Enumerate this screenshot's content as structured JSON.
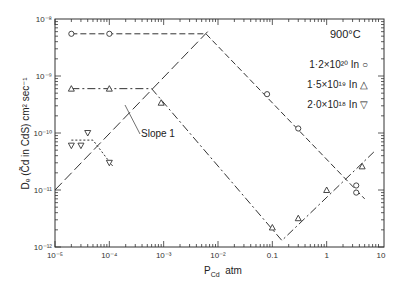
{
  "chart_data": {
    "type": "scatter",
    "title": "",
    "annotation_temperature": "900°C",
    "annotation_slope": "Slope 1",
    "xlabel": "P",
    "xlabel_sub": "Cd",
    "xlabel_unit": "atm",
    "ylabel": "D (Cd in CdS) cm² sec⁻¹",
    "ylabel_display": "Dₑ (C̃d in CdS) cm² sec⁻¹",
    "xscale": "log",
    "yscale": "log",
    "xlim": [
      1e-05,
      10
    ],
    "ylim": [
      1e-12,
      1e-08
    ],
    "x_ticks": [
      "10⁻⁵",
      "10⁻⁴",
      "10⁻³",
      "10⁻²",
      "0.1",
      "1",
      "10"
    ],
    "y_ticks": [
      "10⁻⁸",
      "10⁻⁹",
      "10⁻¹⁰",
      "10⁻¹¹",
      "10⁻¹²"
    ],
    "legend": [
      {
        "label": "1·2×10²⁰ In",
        "marker": "circle"
      },
      {
        "label": "1·5×10¹⁹ In",
        "marker": "triangle-up"
      },
      {
        "label": "2·0×10¹⁸ In",
        "marker": "triangle-down"
      }
    ],
    "series": [
      {
        "name": "1·2×10²⁰ In",
        "marker": "circle",
        "x": [
          2e-05,
          0.0001,
          0.08,
          0.3,
          3.5,
          3.5
        ],
        "y": [
          5.5e-09,
          5.5e-09,
          4.8e-10,
          1.2e-10,
          1.2e-11,
          9e-12
        ]
      },
      {
        "name": "1·5×10¹⁹ In",
        "marker": "triangle-up",
        "x": [
          2e-05,
          0.0001,
          0.0009,
          0.1,
          0.3,
          1.0,
          4.5
        ],
        "y": [
          6e-10,
          6e-10,
          3.4e-10,
          2.2e-12,
          3.2e-12,
          1e-11,
          2.6e-11
        ]
      },
      {
        "name": "2·0×10¹⁸ In",
        "marker": "triangle-down",
        "x": [
          4e-05,
          2e-05,
          3e-05,
          0.0001
        ],
        "y": [
          1e-10,
          6e-11,
          6e-11,
          3e-11
        ]
      }
    ],
    "lines": [
      {
        "name": "slope-1",
        "style": "long-dash",
        "x": [
          1e-05,
          0.007
        ],
        "y": [
          1e-11,
          6.5e-09
        ]
      },
      {
        "name": "1·2×10²⁰ plateau+decline",
        "style": "dashed",
        "x": [
          2e-05,
          0.006,
          5
        ],
        "y": [
          5.5e-09,
          5.5e-09,
          7e-12
        ]
      },
      {
        "name": "1·5×10¹⁹ plateau+decline+rise",
        "style": "dash-dot",
        "x": [
          2e-05,
          0.0006,
          0.15,
          8
        ],
        "y": [
          6e-10,
          6e-10,
          1.3e-12,
          5e-11
        ]
      },
      {
        "name": "2·0×10¹⁸ plateau+decline",
        "style": "dotted",
        "x": [
          2e-05,
          5e-05,
          0.00012
        ],
        "y": [
          7.5e-11,
          7.5e-11,
          2.5e-11
        ]
      }
    ]
  }
}
